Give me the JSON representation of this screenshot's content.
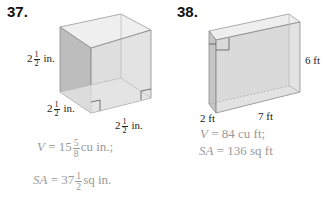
{
  "problems": [
    {
      "number": "37.",
      "shape": "cube",
      "labels": [
        {
          "whole": "2",
          "num": "1",
          "den": "2",
          "unit": "in.",
          "position": "height"
        },
        {
          "whole": "2",
          "num": "1",
          "den": "2",
          "unit": "in.",
          "position": "depth"
        },
        {
          "whole": "2",
          "num": "1",
          "den": "2",
          "unit": "in.",
          "position": "width"
        }
      ],
      "answer": {
        "v_label": "V",
        "v_eq": "= 15",
        "v_num": "5",
        "v_den": "8",
        "v_unit": "cu in.;",
        "sa_label": "SA",
        "sa_eq": "= 37",
        "sa_num": "1",
        "sa_den": "2",
        "sa_unit": "sq in."
      }
    },
    {
      "number": "38.",
      "shape": "rectangular-prism",
      "labels": [
        {
          "text": "6 ft",
          "position": "height"
        },
        {
          "text": "2 ft",
          "position": "depth"
        },
        {
          "text": "7 ft",
          "position": "length"
        }
      ],
      "answer": {
        "v_label": "V",
        "v_text": "= 84 cu ft;",
        "sa_label": "SA",
        "sa_text": "= 136 sq ft"
      }
    }
  ],
  "colors": {
    "answer_text": "#9a9a9a",
    "face_dark": "#c4c4c4",
    "face_light": "#e6e6e6",
    "edge": "#8a8a8a"
  }
}
